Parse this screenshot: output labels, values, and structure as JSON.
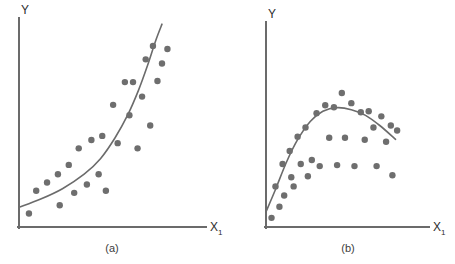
{
  "figure": {
    "background_color": "#ffffff",
    "axis_color": "#6b6b6b",
    "point_color": "#6e6e6e",
    "curve_color": "#6b6b6b",
    "text_color": "#2e2e2e",
    "point_radius": 3.2,
    "axis_width": 2,
    "curve_width": 1.6
  },
  "chart_data": [
    {
      "type": "scatter",
      "panel": "a",
      "caption": "(a)",
      "title": "",
      "xlabel": "X₁",
      "ylabel": "Y",
      "xlabel_text": "X",
      "xlabel_subscript": "1",
      "ylabel_text": "Y",
      "grid": false,
      "legend": "none",
      "xlim": [
        0,
        1
      ],
      "ylim": [
        0,
        1
      ],
      "description": "Scatter of Y versus X1 showing a convex, exponentially increasing relationship with a fitted smooth curve rising steeply at the right.",
      "points": [
        {
          "x": 0.055,
          "y": 0.065
        },
        {
          "x": 0.095,
          "y": 0.175
        },
        {
          "x": 0.155,
          "y": 0.215
        },
        {
          "x": 0.215,
          "y": 0.255
        },
        {
          "x": 0.225,
          "y": 0.105
        },
        {
          "x": 0.275,
          "y": 0.3
        },
        {
          "x": 0.305,
          "y": 0.165
        },
        {
          "x": 0.33,
          "y": 0.38
        },
        {
          "x": 0.375,
          "y": 0.205
        },
        {
          "x": 0.4,
          "y": 0.42
        },
        {
          "x": 0.44,
          "y": 0.255
        },
        {
          "x": 0.46,
          "y": 0.44
        },
        {
          "x": 0.48,
          "y": 0.175
        },
        {
          "x": 0.52,
          "y": 0.59
        },
        {
          "x": 0.545,
          "y": 0.405
        },
        {
          "x": 0.585,
          "y": 0.7
        },
        {
          "x": 0.61,
          "y": 0.54
        },
        {
          "x": 0.63,
          "y": 0.7
        },
        {
          "x": 0.655,
          "y": 0.38
        },
        {
          "x": 0.68,
          "y": 0.63
        },
        {
          "x": 0.7,
          "y": 0.81
        },
        {
          "x": 0.725,
          "y": 0.49
        },
        {
          "x": 0.74,
          "y": 0.875
        },
        {
          "x": 0.765,
          "y": 0.705
        },
        {
          "x": 0.79,
          "y": 0.79
        },
        {
          "x": 0.82,
          "y": 0.86
        }
      ],
      "curve": {
        "kind": "exponential",
        "label": "fitted smooth curve",
        "anchors": [
          {
            "x": 0.0,
            "y": 0.095
          },
          {
            "x": 0.12,
            "y": 0.135
          },
          {
            "x": 0.24,
            "y": 0.185
          },
          {
            "x": 0.36,
            "y": 0.255
          },
          {
            "x": 0.45,
            "y": 0.33
          },
          {
            "x": 0.53,
            "y": 0.43
          },
          {
            "x": 0.6,
            "y": 0.54
          },
          {
            "x": 0.66,
            "y": 0.66
          },
          {
            "x": 0.71,
            "y": 0.78
          },
          {
            "x": 0.755,
            "y": 0.9
          },
          {
            "x": 0.79,
            "y": 0.98
          }
        ]
      }
    },
    {
      "type": "scatter",
      "panel": "b",
      "caption": "(b)",
      "title": "",
      "xlabel": "X₁",
      "ylabel": "Y",
      "xlabel_text": "X",
      "xlabel_subscript": "1",
      "ylabel_text": "Y",
      "grid": false,
      "legend": "none",
      "xlim": [
        0,
        1
      ],
      "ylim": [
        0,
        1
      ],
      "description": "Scatter of Y versus X1 showing a concave-down relationship that rises, peaks near the middle, then gradually declines, with a fitted smooth curve.",
      "points": [
        {
          "x": 0.035,
          "y": 0.045
        },
        {
          "x": 0.06,
          "y": 0.2
        },
        {
          "x": 0.085,
          "y": 0.1
        },
        {
          "x": 0.105,
          "y": 0.31
        },
        {
          "x": 0.115,
          "y": 0.155
        },
        {
          "x": 0.15,
          "y": 0.375
        },
        {
          "x": 0.16,
          "y": 0.245
        },
        {
          "x": 0.175,
          "y": 0.2
        },
        {
          "x": 0.2,
          "y": 0.445
        },
        {
          "x": 0.22,
          "y": 0.31
        },
        {
          "x": 0.25,
          "y": 0.49
        },
        {
          "x": 0.265,
          "y": 0.25
        },
        {
          "x": 0.29,
          "y": 0.33
        },
        {
          "x": 0.32,
          "y": 0.56
        },
        {
          "x": 0.34,
          "y": 0.3
        },
        {
          "x": 0.375,
          "y": 0.6
        },
        {
          "x": 0.4,
          "y": 0.44
        },
        {
          "x": 0.43,
          "y": 0.59
        },
        {
          "x": 0.45,
          "y": 0.305
        },
        {
          "x": 0.48,
          "y": 0.66
        },
        {
          "x": 0.5,
          "y": 0.44
        },
        {
          "x": 0.54,
          "y": 0.61
        },
        {
          "x": 0.56,
          "y": 0.3
        },
        {
          "x": 0.6,
          "y": 0.565
        },
        {
          "x": 0.625,
          "y": 0.43
        },
        {
          "x": 0.65,
          "y": 0.57
        },
        {
          "x": 0.68,
          "y": 0.49
        },
        {
          "x": 0.7,
          "y": 0.3
        },
        {
          "x": 0.73,
          "y": 0.545
        },
        {
          "x": 0.76,
          "y": 0.42
        },
        {
          "x": 0.79,
          "y": 0.5
        },
        {
          "x": 0.8,
          "y": 0.255
        },
        {
          "x": 0.83,
          "y": 0.475
        }
      ],
      "curve": {
        "kind": "quadratic-concave",
        "label": "fitted smooth curve",
        "anchors": [
          {
            "x": 0.0,
            "y": 0.075
          },
          {
            "x": 0.06,
            "y": 0.185
          },
          {
            "x": 0.13,
            "y": 0.32
          },
          {
            "x": 0.2,
            "y": 0.43
          },
          {
            "x": 0.28,
            "y": 0.52
          },
          {
            "x": 0.36,
            "y": 0.57
          },
          {
            "x": 0.45,
            "y": 0.588
          },
          {
            "x": 0.54,
            "y": 0.578
          },
          {
            "x": 0.63,
            "y": 0.55
          },
          {
            "x": 0.72,
            "y": 0.5
          },
          {
            "x": 0.82,
            "y": 0.432
          }
        ]
      }
    }
  ]
}
